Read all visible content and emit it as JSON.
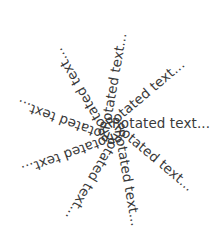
{
  "figure": {
    "title": "",
    "background_color": "#ffffff",
    "text_color": "#3a3a3a",
    "width": 217,
    "height": 231,
    "center": {
      "x": 112,
      "y": 124
    },
    "label": "Rotated text...",
    "font_size_px": 13.5
  },
  "chart_data": {
    "type": "scatter",
    "title": "",
    "subtitle": "",
    "xlabel": "",
    "ylabel": "",
    "grid": false,
    "legend": null,
    "annotation_text": "Rotated text...",
    "center": {
      "x": 112,
      "y": 124
    },
    "angle_step_degrees": 40,
    "series": [
      {
        "name": "Rotated text labels",
        "values": [
          0,
          40,
          80,
          120,
          160,
          200,
          240,
          280,
          320
        ]
      }
    ],
    "labels": [
      {
        "index": 0,
        "text": "Rotated text...",
        "angle": 0
      },
      {
        "index": 1,
        "text": "Rotated text...",
        "angle": 40
      },
      {
        "index": 2,
        "text": "Rotated text...",
        "angle": 80
      },
      {
        "index": 3,
        "text": "Rotated text...",
        "angle": 120
      },
      {
        "index": 4,
        "text": "Rotated text...",
        "angle": 160
      },
      {
        "index": 5,
        "text": "Rotated text...",
        "angle": 200
      },
      {
        "index": 6,
        "text": "Rotated text...",
        "angle": 240
      },
      {
        "index": 7,
        "text": "Rotated text...",
        "angle": 280
      },
      {
        "index": 8,
        "text": "Rotated text...",
        "angle": 320
      }
    ]
  }
}
